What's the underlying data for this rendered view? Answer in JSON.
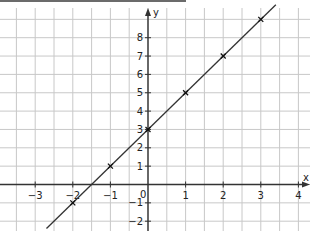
{
  "chart_data": {
    "type": "line",
    "title": "",
    "xlabel": "x",
    "ylabel": "y",
    "xlim": [
      -3.9,
      4.1
    ],
    "ylim": [
      -2.5,
      9.9
    ],
    "grid": true,
    "grid_step_x": 0.5,
    "grid_step_y": 1,
    "x_ticks": [
      -3,
      -2,
      -1,
      1,
      2,
      3,
      4
    ],
    "y_ticks": [
      -2,
      -1,
      1,
      2,
      3,
      4,
      5,
      6,
      7,
      8
    ],
    "origin_label": "0",
    "series": [
      {
        "name": "y = 2x + 3",
        "x": [
          -2,
          -1,
          0,
          1,
          2,
          3
        ],
        "y": [
          -1,
          1,
          3,
          5,
          7,
          9
        ],
        "marker": "x",
        "line_extends_from": [
          -2.7,
          -2.4
        ],
        "line_extends_to": [
          3.4,
          9.8
        ]
      }
    ],
    "legend": null
  },
  "colors": {
    "grid": "#c8c8c8",
    "axis": "#333333",
    "line": "#333333",
    "top_bar": "#6b6b6b"
  },
  "labels": {
    "x_axis": "x",
    "y_axis": "y",
    "origin": "0",
    "x_tick_labels": [
      "−3",
      "−2",
      "−1",
      "1",
      "2",
      "3",
      "4"
    ],
    "y_tick_labels": [
      "−2",
      "−1",
      "1",
      "2",
      "3",
      "4",
      "5",
      "6",
      "7",
      "8"
    ]
  }
}
